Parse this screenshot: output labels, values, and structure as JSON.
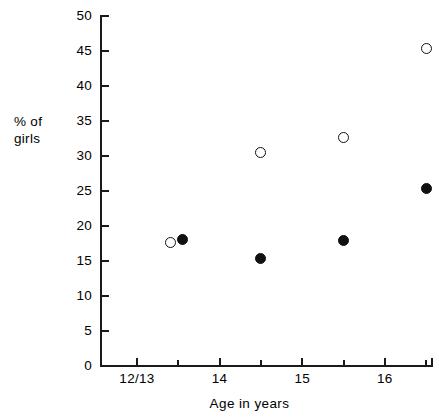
{
  "chart_data": {
    "type": "scatter",
    "title": "",
    "xlabel": "Age in years",
    "ylabel": "% of\ngirls",
    "xlim": [
      12.6,
      17.0
    ],
    "ylim": [
      0,
      50
    ],
    "grid": false,
    "legend": "none",
    "y_ticks": [
      0,
      5,
      10,
      15,
      20,
      25,
      30,
      35,
      40,
      45,
      50
    ],
    "y_tick_labels": [
      "0",
      "5",
      "10",
      "15",
      "20",
      "25",
      "30",
      "35",
      "40",
      "45",
      "50"
    ],
    "x_ticks": [
      13,
      13.5,
      14,
      14.5,
      15,
      15.5,
      16,
      16.5
    ],
    "x_tick_labels": [
      "12/13",
      "",
      "14",
      "",
      "15",
      "",
      "16",
      ""
    ],
    "x_major_ticks": [
      13,
      14,
      15,
      16
    ],
    "x_minor_ticks": [
      13.5,
      14.5,
      15.5,
      16.5
    ],
    "series": [
      {
        "name": "open-circles",
        "marker": "open-circle",
        "color": "#111111",
        "points": [
          {
            "x": 13.4,
            "y": 17.7
          },
          {
            "x": 14.5,
            "y": 30.5
          },
          {
            "x": 15.5,
            "y": 32.6
          },
          {
            "x": 16.5,
            "y": 45.3
          }
        ]
      },
      {
        "name": "filled-circles",
        "marker": "filled-circle",
        "color": "#111111",
        "points": [
          {
            "x": 13.55,
            "y": 18.1
          },
          {
            "x": 14.5,
            "y": 15.4
          },
          {
            "x": 15.5,
            "y": 17.9
          },
          {
            "x": 16.5,
            "y": 25.3
          }
        ]
      }
    ]
  },
  "axes": {
    "y_title": "% of\ngirls",
    "x_title": "Age in years",
    "y_tick_labels": [
      "50",
      "45",
      "40",
      "35",
      "30",
      "25",
      "20",
      "15",
      "10",
      "5",
      "0"
    ],
    "x_tick_labels": [
      "12/13",
      "14",
      "15",
      "16"
    ]
  }
}
